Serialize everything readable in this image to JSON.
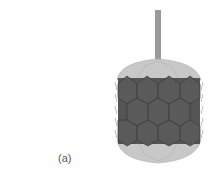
{
  "figure": {
    "panel_label": "(a)",
    "colors": {
      "tail": "#9a9a9a",
      "cap": "#c8c8c8",
      "cap_edge": "#aaaaaa",
      "body": "#555555",
      "body_edge": "#3a3a3a",
      "fiber": "#6e6e6e"
    }
  }
}
